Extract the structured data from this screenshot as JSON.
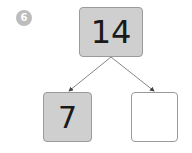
{
  "question": {
    "number": "6"
  },
  "part_whole": {
    "whole": "14",
    "parts": [
      {
        "value": "7",
        "shaded": true
      },
      {
        "value": "",
        "shaded": false
      }
    ]
  },
  "colors": {
    "shaded_box": "#cfcfcf",
    "empty_box": "#ffffff",
    "border": "#9a9a9a",
    "badge": "#bdbdbd",
    "arrow": "#555555"
  }
}
